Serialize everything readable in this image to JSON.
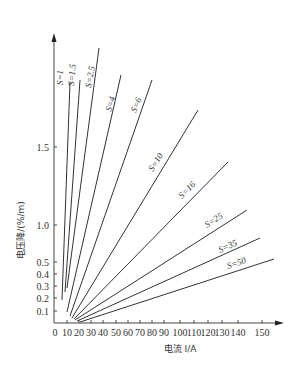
{
  "chart_data": {
    "type": "line",
    "title": "",
    "xlabel": "电流 I/A",
    "ylabel": "电压降/(%/m)",
    "x_ticks": [
      0,
      10,
      20,
      30,
      40,
      50,
      60,
      70,
      80,
      90,
      100,
      110,
      120,
      130,
      140,
      150
    ],
    "y_ticks": [
      0.1,
      0.2,
      0.3,
      0.4,
      0.5,
      1.0,
      1.5
    ],
    "xlim": [
      0,
      160
    ],
    "ylim": [
      0,
      2.2
    ],
    "grid": false,
    "legend": "inline labels along lines",
    "series": [
      {
        "name": "S=1",
        "label": "S=1",
        "x": [
          5,
          12
        ],
        "y": [
          0.2,
          2.0
        ]
      },
      {
        "name": "S=1.5",
        "label": "S=1.5",
        "x": [
          7,
          19
        ],
        "y": [
          0.3,
          2.0
        ]
      },
      {
        "name": "S=2.5",
        "label": "S=2.5",
        "x": [
          8,
          32
        ],
        "y": [
          0.3,
          2.3
        ]
      },
      {
        "name": "S=4",
        "label": "S=4",
        "x": [
          9,
          47
        ],
        "y": [
          0.15,
          2.1
        ]
      },
      {
        "name": "S=6",
        "label": "S=6",
        "x": [
          11,
          70
        ],
        "y": [
          0.1,
          2.05
        ]
      },
      {
        "name": "S=10",
        "label": "S=10",
        "x": [
          12,
          103
        ],
        "y": [
          0.05,
          1.75
        ]
      },
      {
        "name": "S=16",
        "label": "S=16",
        "x": [
          13,
          125
        ],
        "y": [
          0.05,
          1.35
        ]
      },
      {
        "name": "S=25",
        "label": "S=25",
        "x": [
          14,
          138
        ],
        "y": [
          0.04,
          1.05
        ]
      },
      {
        "name": "S=35",
        "label": "S=35",
        "x": [
          15,
          147
        ],
        "y": [
          0.03,
          0.8
        ]
      },
      {
        "name": "S=50",
        "label": "S=50",
        "x": [
          16,
          157
        ],
        "y": [
          0.02,
          0.55
        ]
      }
    ]
  },
  "render": {
    "axis": {
      "x0": 54,
      "y0": 323,
      "x_end": 284,
      "y_top": 33
    },
    "x_tick_px": [
      55,
      67,
      79,
      91,
      103,
      116,
      128,
      140,
      152,
      164,
      180,
      194,
      208,
      222,
      238,
      262
    ],
    "y_tick_px": [
      311,
      298,
      286,
      274,
      262,
      225,
      147
    ],
    "lines": [
      {
        "x1": 62,
        "y1": 300,
        "x2": 70,
        "y2": 82,
        "lx": 63,
        "ly": 85,
        "rot": -90
      },
      {
        "x1": 65,
        "y1": 292,
        "x2": 80,
        "y2": 80,
        "lx": 74,
        "ly": 86,
        "rot": -86
      },
      {
        "x1": 67,
        "y1": 288,
        "x2": 99,
        "y2": 48,
        "lx": 91,
        "ly": 88,
        "rot": -80
      },
      {
        "x1": 67,
        "y1": 312,
        "x2": 121,
        "y2": 75,
        "lx": 111,
        "ly": 112,
        "rot": -74
      },
      {
        "x1": 70,
        "y1": 316,
        "x2": 152,
        "y2": 80,
        "lx": 136,
        "ly": 113,
        "rot": -68
      },
      {
        "x1": 72,
        "y1": 318,
        "x2": 198,
        "y2": 110,
        "lx": 153,
        "ly": 172,
        "rot": -58
      },
      {
        "x1": 74,
        "y1": 319,
        "x2": 228,
        "y2": 162,
        "lx": 182,
        "ly": 199,
        "rot": -45
      },
      {
        "x1": 75,
        "y1": 320,
        "x2": 247,
        "y2": 210,
        "lx": 207,
        "ly": 228,
        "rot": -33
      },
      {
        "x1": 77,
        "y1": 321,
        "x2": 260,
        "y2": 238,
        "lx": 220,
        "ly": 253,
        "rot": -25
      },
      {
        "x1": 80,
        "y1": 322,
        "x2": 274,
        "y2": 259,
        "lx": 228,
        "ly": 269,
        "rot": -18
      }
    ]
  }
}
